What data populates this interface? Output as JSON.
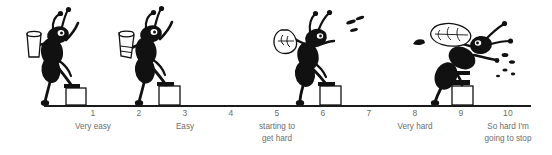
{
  "figure": {
    "name": "perceived-exertion-ant-scale",
    "background_color": "#ffffff",
    "axis_color": "#1a1a1a",
    "text_color": "#6d6d6d",
    "ink_color": "#111111"
  },
  "scale": {
    "ticks": [
      {
        "number": "1",
        "label": "Very easy",
        "x": 93
      },
      {
        "number": "2",
        "label": "",
        "x": 139
      },
      {
        "number": "3",
        "label": "Easy",
        "x": 185
      },
      {
        "number": "4",
        "label": "",
        "x": 231
      },
      {
        "number": "5",
        "label": "starting to\nget hard",
        "x": 277
      },
      {
        "number": "6",
        "label": "",
        "x": 323
      },
      {
        "number": "7",
        "label": "",
        "x": 369
      },
      {
        "number": "8",
        "label": "Very hard",
        "x": 415
      },
      {
        "number": "9",
        "label": "",
        "x": 461
      },
      {
        "number": "10",
        "label": "So hard I'm\ngoing to stop",
        "x": 508
      }
    ]
  },
  "illustrations": [
    {
      "name": "ant-climbing-step-1",
      "description": "ant carrying bucket, upright, stepping up first block",
      "at_tick": "1"
    },
    {
      "name": "ant-climbing-step-2",
      "description": "ant carrying bucket, upright, stepping up second block",
      "at_tick": "3"
    },
    {
      "name": "ant-climbing-step-3",
      "description": "ant straining with bucket overhead, sweat drops",
      "at_tick": "5"
    },
    {
      "name": "ant-climbing-step-4",
      "description": "ant hunched over, bucket spilling, heavy sweat drops",
      "at_tick": "9"
    }
  ]
}
